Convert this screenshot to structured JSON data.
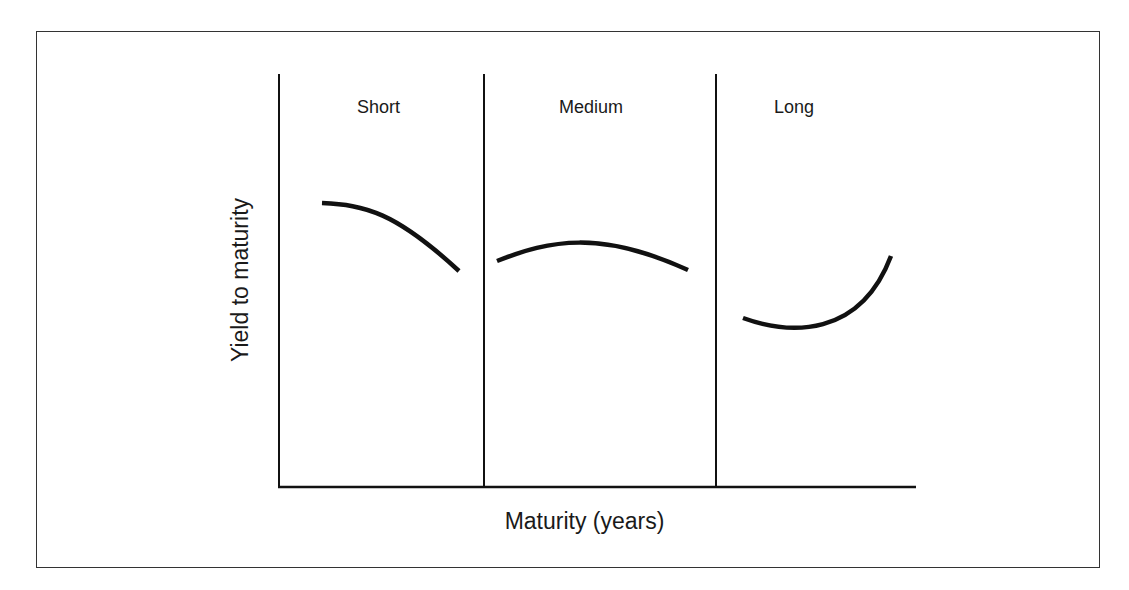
{
  "diagram": {
    "title": "",
    "x_axis_label": "Maturity (years)",
    "y_axis_label": "Yield to maturity",
    "regions": [
      {
        "label": "Short",
        "curve_shape": "downward sloping (inverted)"
      },
      {
        "label": "Medium",
        "curve_shape": "humped"
      },
      {
        "label": "Long",
        "curve_shape": "upward sloping (U-shaped)"
      }
    ],
    "colors": {
      "line": "#111111",
      "frame": "#333333",
      "background": "#ffffff"
    }
  }
}
